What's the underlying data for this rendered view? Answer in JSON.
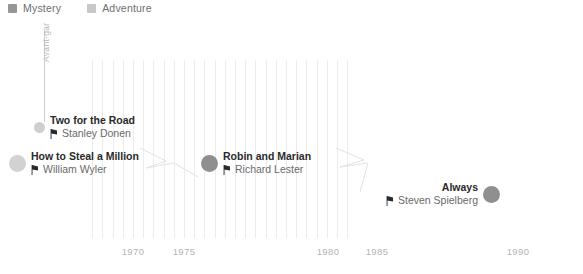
{
  "legend": {
    "items": [
      {
        "label": "Mystery",
        "color": "#969696",
        "icon": "square-swatch-icon"
      },
      {
        "label": "Adventure",
        "color": "#c8c8c8",
        "icon": "square-swatch-icon"
      }
    ]
  },
  "axis": {
    "ticks": [
      {
        "label": "1970",
        "x": 133
      },
      {
        "label": "1975",
        "x": 184
      },
      {
        "label": "1980",
        "x": 328
      },
      {
        "label": "1985",
        "x": 377
      },
      {
        "label": "1990",
        "x": 518
      }
    ],
    "gridline_color": "#ececec",
    "tick_color": "#b4b4b4"
  },
  "stem": {
    "label": "Avant-gar",
    "color": "#cfcfcf"
  },
  "chart_data": {
    "type": "scatter",
    "title": "",
    "xlabel": "",
    "ylabel": "",
    "xlim": [
      1966,
      1991
    ],
    "x_tick_labels": [
      "1970",
      "1975",
      "1980",
      "1985",
      "1990"
    ],
    "grid": true,
    "legend_position": "top-left",
    "series": [
      {
        "name": "Mystery",
        "color": "#969696"
      },
      {
        "name": "Adventure",
        "color": "#c8c8c8"
      }
    ],
    "points": [
      {
        "title": "Two for the Road",
        "director": "Stanley Donen",
        "genre": "Adventure",
        "year": 1967,
        "color": "#cfcfcf",
        "dot_size": 11,
        "label_side": "right"
      },
      {
        "title": "How to Steal a Million",
        "director": "William Wyler",
        "genre": "Adventure",
        "year": 1966,
        "color": "#d2d2d2",
        "dot_size": 17,
        "label_side": "right"
      },
      {
        "title": "Robin and Marian",
        "director": "Richard Lester",
        "genre": "Mystery",
        "year": 1976,
        "color": "#8f8f8f",
        "dot_size": 17,
        "label_side": "right"
      },
      {
        "title": "Always",
        "director": "Steven Spielberg",
        "genre": "Mystery",
        "year": 1989,
        "color": "#8f8f8f",
        "dot_size": 17,
        "label_side": "left"
      }
    ]
  },
  "entries": [
    {
      "title": "Two for the Road",
      "director": "Stanley Donen",
      "dot_color": "#cfcfcf",
      "dot_size": 11,
      "dot_left": 34,
      "text_left": 55,
      "top": 114
    },
    {
      "title": "How to Steal a Million",
      "director": "William Wyler",
      "dot_color": "#d2d2d2",
      "dot_size": 17,
      "dot_left": 9,
      "text_left": 31,
      "top": 150
    },
    {
      "title": "Robin and Marian",
      "director": "Richard Lester",
      "dot_color": "#8f8f8f",
      "dot_size": 17,
      "dot_left": 201,
      "text_left": 223,
      "top": 150
    },
    {
      "title": "Always",
      "director": "Steven Spielberg",
      "dot_color": "#8f8f8f",
      "dot_size": 17,
      "dot_left": 481,
      "text_left": 386,
      "top": 181
    }
  ],
  "icons": {
    "director": "film-clapper-icon"
  }
}
